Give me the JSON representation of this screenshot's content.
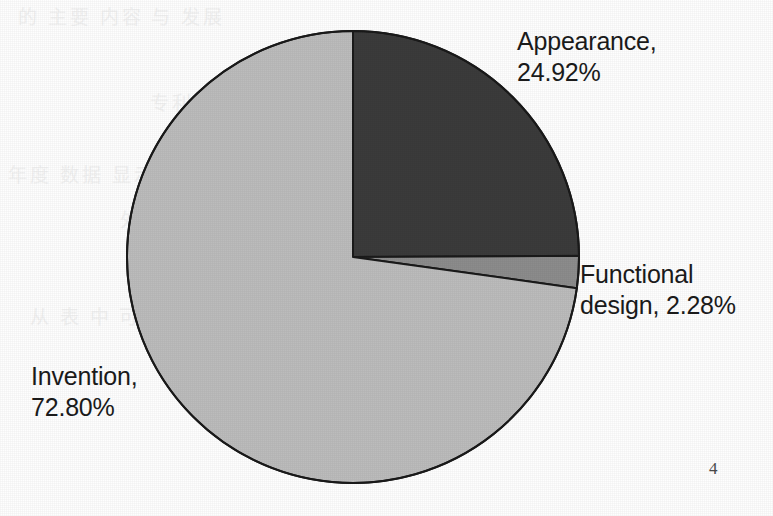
{
  "page": {
    "page_number": "4",
    "background_color": "#fefefe"
  },
  "bleed_through_lines": [
    "的 主要 内容 与 发展",
    "专利 申请 量 统计 分析 表",
    "年度 数据 显示 发明 专利 占 比",
    "外观 设计 与 实用 新型 比例",
    "从 表 中 可以 看出 趋势 变化"
  ],
  "chart_data": {
    "type": "pie",
    "title": "",
    "subtitle": "",
    "xlabel": "",
    "ylabel": "",
    "legend_position": "none",
    "grid": false,
    "label_format": "{name}, {value}%",
    "start_angle_deg": 0,
    "direction": "clockwise",
    "center": {
      "x": 353,
      "y": 257
    },
    "radius": 226,
    "outline_color": "#1a1a1a",
    "outline_width": 2,
    "categories": [
      "Appearance",
      "Functional design",
      "Invention"
    ],
    "values": [
      24.92,
      2.28,
      72.8
    ],
    "colors": [
      "#3b3b3b",
      "#8c8c8c",
      "#bcbcbc"
    ],
    "slices": [
      {
        "name": "Appearance",
        "value": 24.92,
        "value_text": "24.92%",
        "color": "#3b3b3b",
        "label": "Appearance,\n24.92%",
        "start_angle_deg": 0,
        "sweep_angle_deg": 89.71
      },
      {
        "name": "Functional design",
        "value": 2.28,
        "value_text": "2.28%",
        "color": "#8c8c8c",
        "label": "Functional\ndesign, 2.28%",
        "start_angle_deg": 89.71,
        "sweep_angle_deg": 8.21
      },
      {
        "name": "Invention",
        "value": 72.8,
        "value_text": "72.80%",
        "color": "#bcbcbc",
        "label": "Invention,\n72.80%",
        "start_angle_deg": 97.92,
        "sweep_angle_deg": 262.08
      }
    ]
  }
}
